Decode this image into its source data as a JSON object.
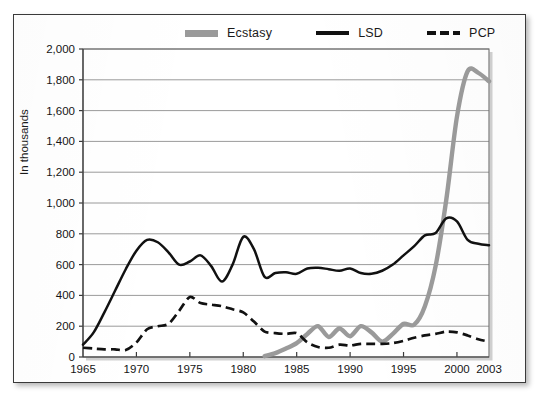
{
  "figure": {
    "y_axis_title": "In thousands",
    "legend": [
      {
        "label": "Ecstasy",
        "style": "solid-gray",
        "color": "#9a9a9a",
        "name": "legend-item-ecstasy"
      },
      {
        "label": "LSD",
        "style": "solid-black",
        "color": "#111111",
        "name": "legend-item-lsd"
      },
      {
        "label": "PCP",
        "style": "dashed-black",
        "color": "#111111",
        "name": "legend-item-pcp"
      }
    ]
  },
  "chart_data": {
    "type": "line",
    "title": "",
    "subtitle": "",
    "xlabel": "",
    "ylabel": "In thousands",
    "xlim": [
      1965,
      2003
    ],
    "ylim": [
      0,
      2000
    ],
    "grid": true,
    "gridlines": "horizontal",
    "legend_position": "top-center",
    "ytick_labels": [
      "0",
      "200",
      "400",
      "600",
      "800",
      "1,000",
      "1,200",
      "1,400",
      "1,600",
      "1,800",
      "2,000"
    ],
    "ytick_values": [
      0,
      200,
      400,
      600,
      800,
      1000,
      1200,
      1400,
      1600,
      1800,
      2000
    ],
    "xtick_labels": [
      "1965",
      "1970",
      "1975",
      "1980",
      "1985",
      "1990",
      "1995",
      "2000",
      "2003"
    ],
    "xtick_values": [
      1965,
      1970,
      1975,
      1980,
      1985,
      1990,
      1995,
      2000,
      2003
    ],
    "series": [
      {
        "name": "Ecstasy",
        "color": "#9a9a9a",
        "dash": "none",
        "width": 4.4,
        "x": [
          1982,
          1983,
          1984,
          1985,
          1986,
          1987,
          1988,
          1989,
          1990,
          1991,
          1992,
          1993,
          1994,
          1995,
          1996,
          1997,
          1998,
          1999,
          2000,
          2001,
          2002,
          2003
        ],
        "y": [
          5,
          25,
          55,
          90,
          150,
          200,
          130,
          185,
          135,
          200,
          160,
          100,
          150,
          215,
          210,
          330,
          590,
          1020,
          1560,
          1855,
          1845,
          1790
        ]
      },
      {
        "name": "LSD",
        "color": "#111111",
        "dash": "none",
        "width": 2.5,
        "x": [
          1965,
          1966,
          1967,
          1968,
          1969,
          1970,
          1971,
          1972,
          1973,
          1974,
          1975,
          1976,
          1977,
          1978,
          1979,
          1980,
          1981,
          1982,
          1983,
          1984,
          1985,
          1986,
          1987,
          1988,
          1989,
          1990,
          1991,
          1992,
          1993,
          1994,
          1995,
          1996,
          1997,
          1998,
          1999,
          2000,
          2001,
          2002,
          2003
        ],
        "y": [
          80,
          160,
          290,
          430,
          570,
          690,
          760,
          745,
          680,
          600,
          620,
          660,
          590,
          490,
          600,
          780,
          700,
          520,
          545,
          550,
          540,
          575,
          580,
          570,
          560,
          575,
          545,
          540,
          560,
          600,
          660,
          720,
          790,
          805,
          900,
          880,
          760,
          735,
          725
        ]
      },
      {
        "name": "PCP",
        "color": "#111111",
        "dash": "9 5",
        "width": 2.7,
        "x": [
          1965,
          1966,
          1967,
          1968,
          1969,
          1970,
          1971,
          1972,
          1973,
          1974,
          1975,
          1976,
          1977,
          1978,
          1979,
          1980,
          1981,
          1982,
          1983,
          1984,
          1985,
          1986,
          1987,
          1988,
          1989,
          1990,
          1991,
          1992,
          1993,
          1994,
          1995,
          1996,
          1997,
          1998,
          1999,
          2000,
          2001,
          2002,
          2003
        ],
        "y": [
          60,
          55,
          50,
          50,
          45,
          95,
          180,
          200,
          215,
          300,
          390,
          350,
          340,
          330,
          310,
          290,
          230,
          165,
          155,
          150,
          155,
          95,
          65,
          60,
          80,
          75,
          85,
          85,
          85,
          90,
          105,
          125,
          140,
          150,
          165,
          160,
          140,
          115,
          100
        ]
      }
    ]
  },
  "geometry": {
    "plot_left": 83,
    "plot_right": 489,
    "plot_top": 49,
    "plot_bottom": 357
  }
}
